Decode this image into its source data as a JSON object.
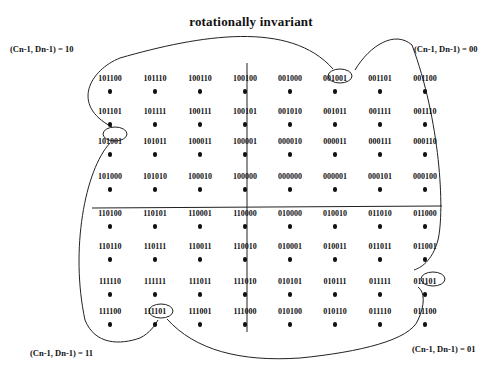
{
  "title": "rotationally invariant",
  "corners": {
    "top_left": "(Cn-1, Dn-1) = 10",
    "top_right": "(Cn-1, Dn-1) = 00",
    "bottom_left": "(Cn-1, Dn-1) = 11",
    "bottom_right": "(Cn-1, Dn-1) = 01"
  },
  "grid": {
    "rows": [
      [
        "101100",
        "101110",
        "100110",
        "100100",
        "001000",
        "001001",
        "001101",
        "001100"
      ],
      [
        "101101",
        "101111",
        "100111",
        "100101",
        "001010",
        "001011",
        "001111",
        "001110"
      ],
      [
        "101001",
        "101011",
        "100011",
        "100001",
        "000010",
        "000011",
        "000111",
        "000110"
      ],
      [
        "101000",
        "101010",
        "100010",
        "100000",
        "000000",
        "000001",
        "000101",
        "000100"
      ],
      [
        "110100",
        "110101",
        "110001",
        "110000",
        "010000",
        "010010",
        "011010",
        "011000"
      ],
      [
        "110110",
        "110111",
        "110011",
        "110010",
        "010001",
        "010011",
        "011011",
        "011001"
      ],
      [
        "111110",
        "111111",
        "111011",
        "111010",
        "010101",
        "010111",
        "011111",
        "011101"
      ],
      [
        "111100",
        "111101",
        "111001",
        "111000",
        "010100",
        "010110",
        "011110",
        "011100"
      ]
    ],
    "circled": [
      {
        "row": 0,
        "col": 6,
        "value": "001101"
      },
      {
        "row": 1,
        "col": 0,
        "value": "101101"
      },
      {
        "row": 6,
        "col": 7,
        "value": "011101"
      },
      {
        "row": 7,
        "col": 1,
        "value": "111101"
      }
    ]
  }
}
